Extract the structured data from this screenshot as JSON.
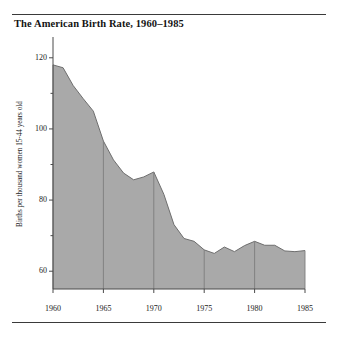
{
  "figure": {
    "title": "The American Birth Rate, 1960–1985",
    "rule_color": "#3a3a3a"
  },
  "chart_data": {
    "type": "area",
    "title": "The American Birth Rate, 1960–1985",
    "xlabel": "",
    "ylabel": "Births per thousand women 15-44 years old",
    "x": [
      1960,
      1961,
      1962,
      1963,
      1964,
      1965,
      1966,
      1967,
      1968,
      1969,
      1970,
      1971,
      1972,
      1973,
      1974,
      1975,
      1976,
      1977,
      1978,
      1979,
      1980,
      1981,
      1982,
      1983,
      1984,
      1985
    ],
    "values": [
      118.0,
      117.2,
      112.2,
      108.5,
      105.0,
      96.6,
      91.3,
      87.6,
      85.7,
      86.5,
      87.9,
      81.6,
      73.1,
      69.2,
      68.4,
      66.0,
      65.0,
      66.8,
      65.5,
      67.2,
      68.4,
      67.3,
      67.3,
      65.7,
      65.5,
      65.8
    ],
    "ylim": [
      55,
      125
    ],
    "xlim": [
      1960,
      1985
    ],
    "yticks": [
      60,
      80,
      100,
      120
    ],
    "ytick_labels": [
      "60",
      "80",
      "100",
      "120"
    ],
    "yminor_ticks": [
      70,
      90,
      110
    ],
    "xticks": [
      1960,
      1965,
      1970,
      1975,
      1980,
      1985
    ],
    "xtick_labels": [
      "1960",
      "1965",
      "1970",
      "1975",
      "1980",
      "1985"
    ],
    "grid": "vertical-at-xticks",
    "legend": "none",
    "fill_color": "#a9a9a9",
    "line_color": "#6e6e6e",
    "gridline_color": "#7d7d7d",
    "axis_color": "#4a4a4a"
  }
}
